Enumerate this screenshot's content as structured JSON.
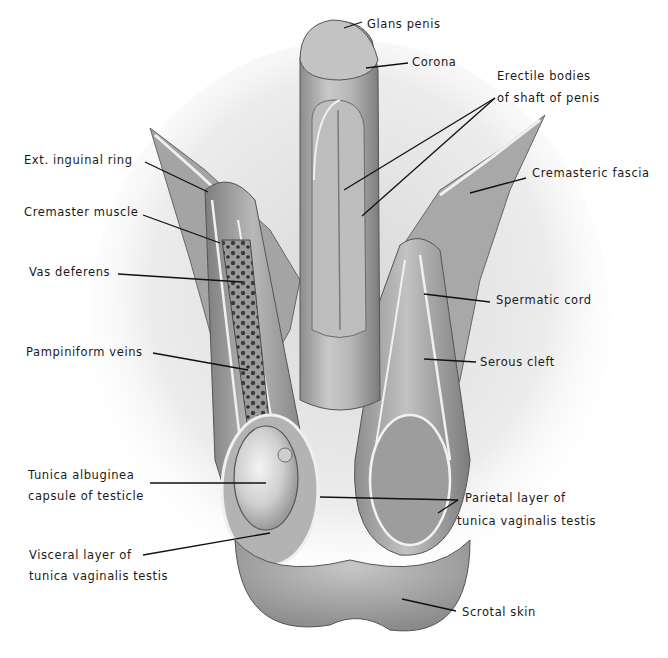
{
  "figure": {
    "colors": {
      "ink": "#1a1a1a",
      "tissue_light": "#d4d4d4",
      "tissue_mid": "#a9a9a9",
      "tissue_dark": "#6e6e6e",
      "highlight": "#f2f2f2",
      "background": "#ffffff"
    }
  },
  "labels": {
    "glans_penis": "Glans penis",
    "corona": "Corona",
    "erectile_bodies_line1": "Erectile bodies",
    "erectile_bodies_line2": "of shaft of penis",
    "ext_inguinal_ring": "Ext. inguinal ring",
    "cremasteric_fascia": "Cremasteric fascia",
    "cremaster_muscle": "Cremaster muscle",
    "vas_deferens": "Vas deferens",
    "spermatic_cord": "Spermatic cord",
    "pampiniform_veins": "Pampiniform veins",
    "serous_cleft": "Serous cleft",
    "tunica_albuginea_line1": "Tunica albuginea",
    "tunica_albuginea_line2": "capsule of testicle",
    "parietal_layer_line1": "Parietal layer of",
    "parietal_layer_line2": "tunica vaginalis testis",
    "visceral_layer_line1": "Visceral layer of",
    "visceral_layer_line2": "tunica vaginalis testis",
    "scrotal_skin": "Scrotal skin"
  }
}
